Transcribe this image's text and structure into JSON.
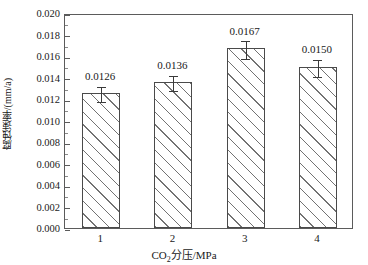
{
  "chart_data": {
    "type": "bar",
    "title": "",
    "subtitle": "",
    "xlabel": "CO2分压/MPa",
    "xlabel_parts": {
      "pre": "CO",
      "sub": "2",
      "post": "分压/MPa"
    },
    "ylabel": "腐蚀速率/(mm/a)",
    "categories": [
      "1",
      "2",
      "3",
      "4"
    ],
    "values": [
      0.0126,
      0.0136,
      0.0167,
      0.015
    ],
    "value_labels": [
      "0.0126",
      "0.0136",
      "0.0167",
      "0.0150"
    ],
    "errors": [
      0.0007,
      0.0007,
      0.0008,
      0.0008
    ],
    "ylim": [
      0.0,
      0.02
    ],
    "xlim": [
      0.5,
      4.5
    ],
    "ytick_labels": [
      "0.000",
      "0.002",
      "0.004",
      "0.006",
      "0.008",
      "0.010",
      "0.012",
      "0.014",
      "0.016",
      "0.018",
      "0.020"
    ],
    "ytick_values": [
      0.0,
      0.002,
      0.004,
      0.006,
      0.008,
      0.01,
      0.012,
      0.014,
      0.016,
      0.018,
      0.02
    ],
    "ytick_minor_values": [
      0.001,
      0.003,
      0.005,
      0.007,
      0.009,
      0.011,
      0.013,
      0.015,
      0.017,
      0.019
    ],
    "xtick_values": [
      1,
      2,
      3,
      4
    ],
    "grid": false,
    "legend": null,
    "legend_position": "none",
    "bar_fill": "hatched-diagonal",
    "bar_edge_color": "#4a4a4a",
    "frame_color": "#5b5b5b",
    "text_color": "#1a1a1a",
    "background": "#ffffff",
    "error_bar_style": "capped"
  }
}
